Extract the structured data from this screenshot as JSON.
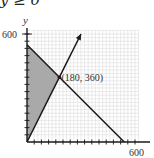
{
  "header": {
    "partial_constraint_text": "y ≥ 0"
  },
  "chart_data": {
    "type": "line",
    "title": "",
    "xlabel": "",
    "ylabel": "y",
    "xlim": [
      0,
      600
    ],
    "ylim": [
      0,
      600
    ],
    "x_tick_labels": [
      "600"
    ],
    "y_tick_labels": [
      "600"
    ],
    "tick_step": 40,
    "grid": true,
    "series": [
      {
        "name": "y = 2x",
        "points": [
          [
            0,
            0
          ],
          [
            180,
            360
          ],
          [
            300,
            600
          ]
        ],
        "arrow_end": true
      },
      {
        "name": "x + y = 540",
        "points": [
          [
            0,
            540
          ],
          [
            180,
            360
          ],
          [
            540,
            0
          ]
        ]
      }
    ],
    "shaded_region": {
      "vertices": [
        [
          0,
          0
        ],
        [
          180,
          360
        ],
        [
          0,
          540
        ]
      ],
      "color": "#a9a9a9"
    },
    "annotations": [
      {
        "text": "(180, 360)",
        "point": [
          180,
          360
        ]
      }
    ]
  },
  "labels": {
    "y_axis": "y",
    "y_max": "600",
    "x_max": "600",
    "intersection": "(180, 360)"
  },
  "colors": {
    "line": "#1a1a1a",
    "shade": "#a9a9a9",
    "grid": "#dcdcdc"
  }
}
